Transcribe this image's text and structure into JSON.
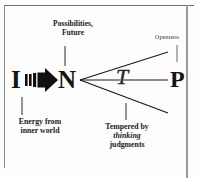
{
  "diagram": {
    "type": "mbti-type-dynamics-diagram",
    "letters": {
      "introversion": "I",
      "intuition": "N",
      "thinking": "T",
      "perceiving": "P"
    },
    "captions": {
      "possibilities": {
        "line1": "Possibilities,",
        "line2": "Future"
      },
      "openness": {
        "line1": "Openness"
      },
      "energy": {
        "line1": "Energy  from",
        "line2": "inner world"
      },
      "tempered": {
        "line1": "Tempered by",
        "line2": "thinking",
        "line3": "judgments"
      }
    },
    "colors": {
      "ink": "#141414",
      "frame": "#8a8a8a",
      "faded_text": "#7b7b7b",
      "background": "#fdfdfd"
    }
  }
}
